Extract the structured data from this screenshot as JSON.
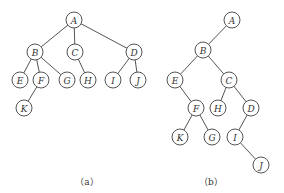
{
  "node_radius": 8,
  "colors": {
    "stroke": "#555555",
    "text": "#333333",
    "background": "#ffffff"
  },
  "trees": [
    {
      "id": "a",
      "caption": "（a）",
      "caption_pos": [
        87,
        181
      ],
      "nodes": [
        {
          "id": "A",
          "label": "A",
          "x": 74,
          "y": 20
        },
        {
          "id": "B",
          "label": "B",
          "x": 35,
          "y": 52
        },
        {
          "id": "C",
          "label": "C",
          "x": 75,
          "y": 52
        },
        {
          "id": "D",
          "label": "D",
          "x": 134,
          "y": 52
        },
        {
          "id": "E",
          "label": "E",
          "x": 20,
          "y": 80
        },
        {
          "id": "F",
          "label": "F",
          "x": 41,
          "y": 80
        },
        {
          "id": "G",
          "label": "G",
          "x": 67,
          "y": 80
        },
        {
          "id": "H",
          "label": "H",
          "x": 88,
          "y": 80
        },
        {
          "id": "I",
          "label": "I",
          "x": 113,
          "y": 80
        },
        {
          "id": "J",
          "label": "J",
          "x": 138,
          "y": 80
        },
        {
          "id": "K",
          "label": "K",
          "x": 24,
          "y": 108
        }
      ],
      "edges": [
        [
          "A",
          "B"
        ],
        [
          "A",
          "C"
        ],
        [
          "A",
          "D"
        ],
        [
          "B",
          "E"
        ],
        [
          "B",
          "F"
        ],
        [
          "B",
          "G"
        ],
        [
          "C",
          "H"
        ],
        [
          "D",
          "I"
        ],
        [
          "D",
          "J"
        ],
        [
          "F",
          "K"
        ]
      ]
    },
    {
      "id": "b",
      "caption": "（b）",
      "caption_pos": [
        211,
        181
      ],
      "nodes": [
        {
          "id": "A",
          "label": "A",
          "x": 232,
          "y": 20
        },
        {
          "id": "B",
          "label": "B",
          "x": 203,
          "y": 50
        },
        {
          "id": "E",
          "label": "E",
          "x": 175,
          "y": 80
        },
        {
          "id": "C",
          "label": "C",
          "x": 229,
          "y": 80
        },
        {
          "id": "F",
          "label": "F",
          "x": 196,
          "y": 108
        },
        {
          "id": "H",
          "label": "H",
          "x": 218,
          "y": 108
        },
        {
          "id": "D",
          "label": "D",
          "x": 251,
          "y": 108
        },
        {
          "id": "K",
          "label": "K",
          "x": 180,
          "y": 137
        },
        {
          "id": "G",
          "label": "G",
          "x": 212,
          "y": 137
        },
        {
          "id": "I",
          "label": "I",
          "x": 235,
          "y": 137
        },
        {
          "id": "J",
          "label": "J",
          "x": 261,
          "y": 165
        }
      ],
      "edges": [
        [
          "A",
          "B"
        ],
        [
          "B",
          "E"
        ],
        [
          "B",
          "C"
        ],
        [
          "E",
          "F"
        ],
        [
          "C",
          "H"
        ],
        [
          "C",
          "D"
        ],
        [
          "F",
          "K"
        ],
        [
          "F",
          "G"
        ],
        [
          "D",
          "I"
        ],
        [
          "I",
          "J"
        ]
      ]
    }
  ]
}
